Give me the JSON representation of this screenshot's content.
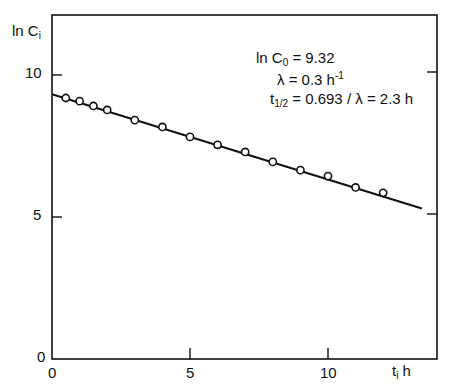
{
  "chart_data": {
    "type": "scatter",
    "title": "",
    "xlabel": "t",
    "xlabel_sub": "i",
    "xlabel_unit": "h",
    "ylabel": "ln C",
    "ylabel_sub": "i",
    "xlim": [
      0,
      14
    ],
    "ylim": [
      0,
      12
    ],
    "x_ticks": [
      0,
      5,
      10
    ],
    "y_ticks": [
      0,
      5,
      10
    ],
    "x_tick_labels": [
      "0",
      "5",
      "10"
    ],
    "y_tick_labels": [
      "0",
      "5",
      "10"
    ],
    "grid": false,
    "series": [
      {
        "name": "measured ln C_i",
        "marker": "open-circle",
        "x": [
          0.5,
          1,
          1.5,
          2,
          3,
          4,
          5,
          6,
          7,
          8,
          9,
          10,
          11,
          12
        ],
        "y": [
          9.19,
          9.08,
          8.91,
          8.77,
          8.41,
          8.17,
          7.82,
          7.54,
          7.29,
          6.94,
          6.65,
          6.44,
          6.04,
          5.85
        ]
      },
      {
        "name": "fit line",
        "type": "line",
        "x": [
          0,
          13.4
        ],
        "y": [
          9.32,
          5.3
        ]
      }
    ],
    "annotations": {
      "line1_main": "ln C",
      "line1_sub": "0",
      "line1_rest": " = 9.32",
      "line2_main": "λ = 0.3 h",
      "line2_sup": "-1",
      "line3_main": "t",
      "line3_sub": "1/2",
      "line3_rest": " = 0.693 / λ = 2.3 h"
    }
  }
}
